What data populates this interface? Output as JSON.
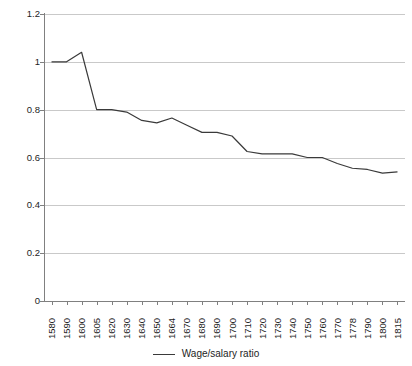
{
  "chart_data": {
    "type": "line",
    "title": "",
    "xlabel": "",
    "ylabel": "",
    "categories": [
      "1580",
      "1590",
      "1600",
      "1605",
      "1620",
      "1630",
      "1640",
      "1650",
      "1664",
      "1670",
      "1680",
      "1690",
      "1700",
      "1710",
      "1720",
      "1730",
      "1740",
      "1750",
      "1760",
      "1770",
      "1778",
      "1790",
      "1800",
      "1815"
    ],
    "series": [
      {
        "name": "Wage/salary ratio",
        "color": "#3a3a3a",
        "values": [
          1.0,
          1.0,
          1.04,
          0.8,
          0.8,
          0.79,
          0.755,
          0.745,
          0.765,
          0.735,
          0.705,
          0.705,
          0.69,
          0.625,
          0.615,
          0.615,
          0.615,
          0.6,
          0.6,
          0.575,
          0.555,
          0.55,
          0.535,
          0.54
        ]
      }
    ],
    "ylim": [
      0,
      1.2
    ],
    "yticks": [
      "0",
      "0.2",
      "0.4",
      "0.6",
      "0.8",
      "1",
      "1.2"
    ],
    "ytick_values": [
      0,
      0.2,
      0.4,
      0.6,
      0.8,
      1,
      1.2
    ],
    "grid": true,
    "legend_position": "bottom",
    "legend": [
      "Wage/salary ratio"
    ]
  },
  "legend": {
    "entry_label": "Wage/salary ratio"
  },
  "colors": {
    "series": "#3a3a3a",
    "grid": "#c9c9c9",
    "axis": "#808080",
    "text": "#1d1d1d",
    "background": "#ffffff"
  }
}
